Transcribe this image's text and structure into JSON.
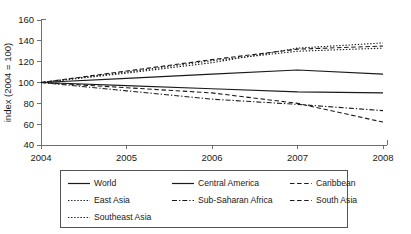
{
  "chart_data": {
    "type": "line",
    "title": "",
    "xlabel": "",
    "ylabel": "index (2004 = 100)",
    "x": [
      2004,
      2005,
      2006,
      2007,
      2008
    ],
    "xticklabels": [
      "2004",
      "2005",
      "2006",
      "2007",
      "2008"
    ],
    "yticklabels": [
      "40",
      "60",
      "80",
      "100",
      "120",
      "140",
      "160"
    ],
    "yticks": [
      40,
      60,
      80,
      100,
      120,
      140,
      160
    ],
    "ylim": [
      40,
      160
    ],
    "xlim": [
      2004,
      2008
    ],
    "grid": false,
    "legend_position": "bottom",
    "series": [
      {
        "name": "World",
        "style": "solid",
        "values": [
          100,
          104,
          108,
          112,
          108
        ]
      },
      {
        "name": "Central America",
        "style": "solid",
        "values": [
          100,
          97,
          94,
          91,
          90
        ]
      },
      {
        "name": "Caribbean",
        "style": "dashed",
        "values": [
          100,
          111,
          122,
          132,
          135
        ]
      },
      {
        "name": "East Asia",
        "style": "dotted",
        "values": [
          100,
          109,
          119,
          133,
          138
        ]
      },
      {
        "name": "Sub-Saharan Africa",
        "style": "dashdot",
        "values": [
          100,
          92,
          84,
          79,
          73
        ]
      },
      {
        "name": "South Asia",
        "style": "dashed",
        "values": [
          100,
          95,
          90,
          80,
          62
        ]
      },
      {
        "name": "Southeast Asia",
        "style": "dotted",
        "values": [
          100,
          110,
          121,
          130,
          133
        ]
      }
    ]
  },
  "legend": {
    "entries": [
      {
        "label": "World",
        "style": "solid"
      },
      {
        "label": "Central America",
        "style": "solid"
      },
      {
        "label": "Caribbean",
        "style": "dashed"
      },
      {
        "label": "East Asia",
        "style": "dotted"
      },
      {
        "label": "Sub-Saharan Africa",
        "style": "dashdot"
      },
      {
        "label": "South Asia",
        "style": "dashed"
      },
      {
        "label": "Southeast Asia",
        "style": "dotted"
      }
    ]
  },
  "colors": {
    "line": "#1a1a1a",
    "axis": "#6f6f6f",
    "legend_border": "#555555",
    "background": "#ffffff"
  }
}
